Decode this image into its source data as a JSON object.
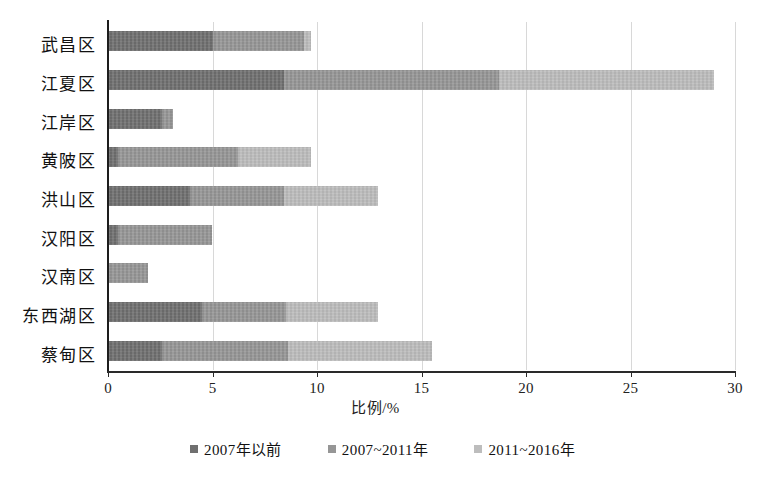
{
  "chart_data": {
    "type": "bar",
    "orientation": "horizontal",
    "stacked": true,
    "title": "",
    "xlabel": "比例/%",
    "ylabel": "",
    "xlim": [
      0,
      30
    ],
    "xticks": [
      0,
      5,
      10,
      15,
      20,
      25,
      30
    ],
    "xtick_labels": [
      "0",
      "5",
      "10",
      "15",
      "20",
      "25",
      "30"
    ],
    "grid": true,
    "grid_axis": "x",
    "legend_position": "bottom",
    "categories": [
      "武昌区",
      "江夏区",
      "江岸区",
      "黄陂区",
      "洪山区",
      "汉阳区",
      "汉南区",
      "东西湖区",
      "蔡甸区"
    ],
    "series": [
      {
        "name": "2007年以前",
        "color": "#6f6f6f",
        "values": [
          5.0,
          8.4,
          2.6,
          0.5,
          3.9,
          0.5,
          0.0,
          4.5,
          2.6
        ]
      },
      {
        "name": "2007~2011年",
        "color": "#969696",
        "values": [
          4.4,
          10.3,
          0.5,
          5.7,
          4.5,
          4.5,
          1.9,
          4.0,
          6.0
        ]
      },
      {
        "name": "2011~2016年",
        "color": "#bdbdbd",
        "values": [
          0.3,
          10.3,
          0.0,
          3.5,
          4.5,
          0.0,
          0.0,
          4.4,
          6.9
        ]
      }
    ],
    "totals": [
      9.7,
      29.0,
      3.1,
      9.7,
      12.9,
      5.0,
      1.9,
      12.9,
      15.5
    ]
  },
  "legend": {
    "items": [
      {
        "label": "2007年以前",
        "swatch": "s0"
      },
      {
        "label": "2007~2011年",
        "swatch": "s1"
      },
      {
        "label": "2011~2016年",
        "swatch": "s2"
      }
    ]
  },
  "axis": {
    "x_title": "比例/%"
  }
}
